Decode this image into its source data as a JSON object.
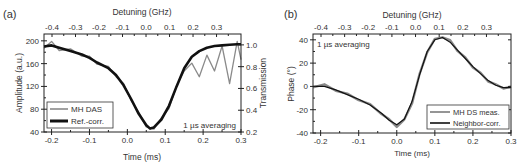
{
  "chart_data": [
    {
      "panel_label": "(a)",
      "type": "line",
      "title": "",
      "xlabel": "Time (ms)",
      "ylabel": "Amplitude (a.u.)",
      "y2label": "Transmission",
      "top_xlabel": "Detuning (GHz)",
      "xlim": [
        -0.22,
        0.3
      ],
      "ylim": [
        40,
        212
      ],
      "y2lim": [
        0.2,
        1.1
      ],
      "xticks": [
        "-0.2",
        "-0.1",
        "0.0",
        "0.1",
        "0.2",
        "0.3"
      ],
      "xtick_values": [
        -0.2,
        -0.1,
        0.0,
        0.1,
        0.2,
        0.3
      ],
      "yticks": [
        "40",
        "80",
        "120",
        "160",
        "200"
      ],
      "ytick_values": [
        40,
        80,
        120,
        160,
        200
      ],
      "y2ticks": [
        "0.2",
        "0.4",
        "0.6",
        "0.8",
        "1.0"
      ],
      "y2tick_values": [
        0.2,
        0.4,
        0.6,
        0.8,
        1.0
      ],
      "top_xticks": [
        "-0.4",
        "-0.3",
        "-0.2",
        "-0.1",
        "0.0",
        "0.1",
        "0.2",
        "0.3"
      ],
      "annotation": "1 µs averaging",
      "grid": false,
      "legend_position": "lower left",
      "legend": [
        "MH DAS",
        "Ref.-corr."
      ],
      "x": [
        -0.22,
        -0.2,
        -0.18,
        -0.15,
        -0.12,
        -0.1,
        -0.08,
        -0.05,
        -0.03,
        -0.01,
        0.01,
        0.03,
        0.05,
        0.06,
        0.07,
        0.09,
        0.11,
        0.13,
        0.15,
        0.17,
        0.19,
        0.21,
        0.23,
        0.25,
        0.27,
        0.29,
        0.3
      ],
      "series": [
        {
          "name": "MH DAS",
          "color": "#8a8a8a",
          "values": [
            190,
            196,
            186,
            183,
            176,
            170,
            162,
            152,
            140,
            122,
            98,
            72,
            52,
            44,
            48,
            62,
            84,
            118,
            150,
            158,
            140,
            172,
            150,
            188,
            128,
            196,
            170
          ]
        },
        {
          "name": "Ref.-corr.",
          "color": "#111111",
          "values": [
            190,
            192,
            188,
            182,
            176,
            170,
            162,
            152,
            140,
            122,
            98,
            72,
            52,
            46,
            48,
            62,
            86,
            120,
            152,
            172,
            182,
            188,
            191,
            192,
            193,
            194,
            194
          ]
        }
      ]
    },
    {
      "panel_label": "(b)",
      "type": "line",
      "title": "",
      "xlabel": "Time (ms)",
      "ylabel": "Phase (°)",
      "top_xlabel": "Detuning (GHz)",
      "xlim": [
        -0.22,
        0.3
      ],
      "ylim": [
        -40,
        45
      ],
      "xticks": [
        "-0.2",
        "-0.1",
        "0.0",
        "0.1",
        "0.2",
        "0.3"
      ],
      "xtick_values": [
        -0.2,
        -0.1,
        0.0,
        0.1,
        0.2,
        0.3
      ],
      "yticks": [
        "-40",
        "-20",
        "0",
        "20",
        "40"
      ],
      "ytick_values": [
        -40,
        -20,
        0,
        20,
        40
      ],
      "top_xticks": [
        "-0.4",
        "-0.3",
        "-0.2",
        "-0.1",
        "0.0",
        "0.1",
        "0.2",
        "0.3"
      ],
      "annotation": "1 µs averaging",
      "grid": false,
      "legend_position": "lower right",
      "legend": [
        "MH DS meas.",
        "Neighbor-corr."
      ],
      "x": [
        -0.22,
        -0.19,
        -0.16,
        -0.13,
        -0.1,
        -0.07,
        -0.04,
        -0.02,
        0.0,
        0.02,
        0.04,
        0.06,
        0.08,
        0.1,
        0.12,
        0.14,
        0.16,
        0.18,
        0.2,
        0.22,
        0.24,
        0.26,
        0.28,
        0.3
      ],
      "series": [
        {
          "name": "MH DS meas.",
          "color": "#8a8a8a",
          "values": [
            0,
            1,
            -3,
            -7,
            -11,
            -16,
            -23,
            -29,
            -34,
            -29,
            -14,
            10,
            30,
            40,
            43,
            39,
            31,
            24,
            17,
            11,
            5,
            1,
            -1,
            -1
          ]
        },
        {
          "name": "Neighbor-corr.",
          "color": "#111111",
          "values": [
            0,
            0,
            -3,
            -7,
            -11,
            -16,
            -23,
            -29,
            -33,
            -28,
            -13,
            10,
            30,
            40,
            42,
            38,
            31,
            24,
            17,
            11,
            5,
            1,
            -1,
            -1
          ]
        }
      ]
    }
  ]
}
